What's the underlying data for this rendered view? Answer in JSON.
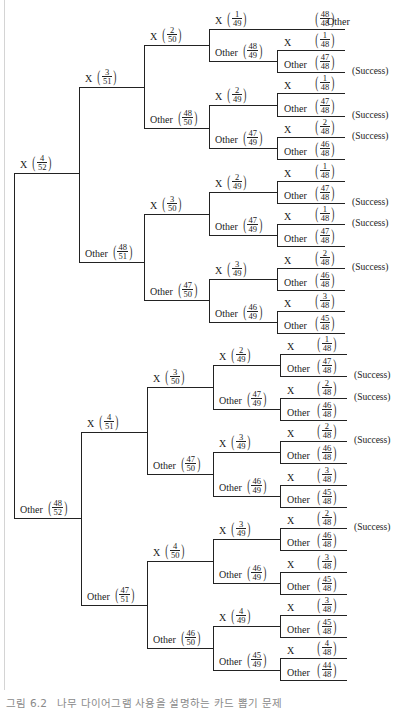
{
  "caption": {
    "figure_number": "그림 6.2",
    "text": "나무 다이어그램 사용을 설명하는 카드 뽑기 문제"
  },
  "success_label": "(Success)",
  "layout": {
    "top_x": [
      14,
      79,
      144,
      209,
      277,
      344
    ],
    "bottom_x": [
      14,
      81,
      147,
      213,
      280,
      346
    ]
  },
  "tree": {
    "y": 345,
    "children": [
      {
        "label": "X",
        "num": "4",
        "den": "52",
        "y": 173,
        "half": "top",
        "children": [
          {
            "label": "X",
            "num": "3",
            "den": "51",
            "y": 87,
            "children": [
              {
                "label": "X",
                "num": "2",
                "den": "50",
                "y": 45,
                "children": [
                  {
                    "label": "X",
                    "num": "1",
                    "den": "49",
                    "y": 29,
                    "single_leaf": {
                      "label": "Other",
                      "num": "48",
                      "den": "48",
                      "y": 29
                    }
                  },
                  {
                    "label": "Other",
                    "num": "48",
                    "den": "49",
                    "y": 61,
                    "children": [
                      {
                        "label": "X",
                        "num": "1",
                        "den": "48",
                        "y": 50
                      },
                      {
                        "label": "Other",
                        "num": "47",
                        "den": "48",
                        "y": 72,
                        "success": true
                      }
                    ]
                  }
                ]
              },
              {
                "label": "Other",
                "num": "48",
                "den": "50",
                "y": 128,
                "children": [
                  {
                    "label": "X",
                    "num": "2",
                    "den": "49",
                    "y": 105,
                    "children": [
                      {
                        "label": "X",
                        "num": "1",
                        "den": "48",
                        "y": 93
                      },
                      {
                        "label": "Other",
                        "num": "47",
                        "den": "48",
                        "y": 116,
                        "success": true
                      }
                    ]
                  },
                  {
                    "label": "Other",
                    "num": "47",
                    "den": "49",
                    "y": 148,
                    "children": [
                      {
                        "label": "X",
                        "num": "2",
                        "den": "48",
                        "y": 137,
                        "success": true
                      },
                      {
                        "label": "Other",
                        "num": "46",
                        "den": "48",
                        "y": 159
                      }
                    ]
                  }
                ]
              }
            ]
          },
          {
            "label": "Other",
            "num": "48",
            "den": "51",
            "y": 262,
            "children": [
              {
                "label": "X",
                "num": "3",
                "den": "50",
                "y": 214,
                "children": [
                  {
                    "label": "X",
                    "num": "2",
                    "den": "49",
                    "y": 192,
                    "children": [
                      {
                        "label": "X",
                        "num": "1",
                        "den": "48",
                        "y": 181
                      },
                      {
                        "label": "Other",
                        "num": "47",
                        "den": "48",
                        "y": 203,
                        "success": true
                      }
                    ]
                  },
                  {
                    "label": "Other",
                    "num": "47",
                    "den": "49",
                    "y": 235,
                    "children": [
                      {
                        "label": "X",
                        "num": "1",
                        "den": "48",
                        "y": 224,
                        "success": true
                      },
                      {
                        "label": "Other",
                        "num": "47",
                        "den": "48",
                        "y": 246
                      }
                    ]
                  }
                ]
              },
              {
                "label": "Other",
                "num": "47",
                "den": "50",
                "y": 300,
                "children": [
                  {
                    "label": "X",
                    "num": "3",
                    "den": "49",
                    "y": 279,
                    "children": [
                      {
                        "label": "X",
                        "num": "2",
                        "den": "48",
                        "y": 268,
                        "success": true
                      },
                      {
                        "label": "Other",
                        "num": "46",
                        "den": "48",
                        "y": 290
                      }
                    ]
                  },
                  {
                    "label": "Other",
                    "num": "46",
                    "den": "49",
                    "y": 322,
                    "children": [
                      {
                        "label": "X",
                        "num": "3",
                        "den": "48",
                        "y": 311
                      },
                      {
                        "label": "Other",
                        "num": "45",
                        "den": "48",
                        "y": 333
                      }
                    ]
                  }
                ]
              }
            ]
          }
        ]
      },
      {
        "label": "Other",
        "num": "48",
        "den": "52",
        "y": 518,
        "half": "bottom",
        "children": [
          {
            "label": "X",
            "num": "4",
            "den": "51",
            "y": 432,
            "children": [
              {
                "label": "X",
                "num": "3",
                "den": "50",
                "y": 387,
                "children": [
                  {
                    "label": "X",
                    "num": "2",
                    "den": "49",
                    "y": 365,
                    "children": [
                      {
                        "label": "X",
                        "num": "1",
                        "den": "48",
                        "y": 354
                      },
                      {
                        "label": "Other",
                        "num": "47",
                        "den": "48",
                        "y": 376,
                        "success": true
                      }
                    ]
                  },
                  {
                    "label": "Other",
                    "num": "47",
                    "den": "49",
                    "y": 409,
                    "children": [
                      {
                        "label": "X",
                        "num": "2",
                        "den": "48",
                        "y": 398,
                        "success": true
                      },
                      {
                        "label": "Other",
                        "num": "46",
                        "den": "48",
                        "y": 420
                      }
                    ]
                  }
                ]
              },
              {
                "label": "Other",
                "num": "47",
                "den": "50",
                "y": 474,
                "children": [
                  {
                    "label": "X",
                    "num": "3",
                    "den": "49",
                    "y": 452,
                    "children": [
                      {
                        "label": "X",
                        "num": "2",
                        "den": "48",
                        "y": 441,
                        "success": true
                      },
                      {
                        "label": "Other",
                        "num": "46",
                        "den": "48",
                        "y": 463
                      }
                    ]
                  },
                  {
                    "label": "Other",
                    "num": "46",
                    "den": "49",
                    "y": 496,
                    "children": [
                      {
                        "label": "X",
                        "num": "3",
                        "den": "48",
                        "y": 485
                      },
                      {
                        "label": "Other",
                        "num": "45",
                        "den": "48",
                        "y": 507
                      }
                    ]
                  }
                ]
              }
            ]
          },
          {
            "label": "Other",
            "num": "47",
            "den": "51",
            "y": 605,
            "children": [
              {
                "label": "X",
                "num": "4",
                "den": "50",
                "y": 561,
                "children": [
                  {
                    "label": "X",
                    "num": "3",
                    "den": "49",
                    "y": 539,
                    "children": [
                      {
                        "label": "X",
                        "num": "2",
                        "den": "48",
                        "y": 528,
                        "success": true
                      },
                      {
                        "label": "Other",
                        "num": "46",
                        "den": "48",
                        "y": 550
                      }
                    ]
                  },
                  {
                    "label": "Other",
                    "num": "46",
                    "den": "49",
                    "y": 583,
                    "children": [
                      {
                        "label": "X",
                        "num": "3",
                        "den": "48",
                        "y": 572
                      },
                      {
                        "label": "Other",
                        "num": "45",
                        "den": "48",
                        "y": 594
                      }
                    ]
                  }
                ]
              },
              {
                "label": "Other",
                "num": "46",
                "den": "50",
                "y": 648,
                "children": [
                  {
                    "label": "X",
                    "num": "4",
                    "den": "49",
                    "y": 626,
                    "children": [
                      {
                        "label": "X",
                        "num": "3",
                        "den": "48",
                        "y": 615
                      },
                      {
                        "label": "Other",
                        "num": "45",
                        "den": "48",
                        "y": 637
                      }
                    ]
                  },
                  {
                    "label": "Other",
                    "num": "45",
                    "den": "49",
                    "y": 670,
                    "children": [
                      {
                        "label": "X",
                        "num": "4",
                        "den": "48",
                        "y": 658
                      },
                      {
                        "label": "Other",
                        "num": "44",
                        "den": "48",
                        "y": 680
                      }
                    ]
                  }
                ]
              }
            ]
          }
        ]
      }
    ]
  }
}
